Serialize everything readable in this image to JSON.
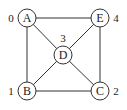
{
  "diagram": {
    "type": "undirected-graph",
    "colors": {
      "stroke": "#333333",
      "node_fill": "#ffffff",
      "text": "#222222",
      "background": "#ffffff"
    },
    "node_radius": 9,
    "nodes": [
      {
        "id": "A",
        "label": "A",
        "index": "0",
        "x": 27,
        "y": 18,
        "index_x": 11,
        "index_y": 22
      },
      {
        "id": "B",
        "label": "B",
        "index": "1",
        "x": 27,
        "y": 91,
        "index_x": 11,
        "index_y": 95
      },
      {
        "id": "C",
        "label": "C",
        "index": "2",
        "x": 100,
        "y": 91,
        "index_x": 116,
        "index_y": 95
      },
      {
        "id": "D",
        "label": "D",
        "index": "3",
        "x": 63,
        "y": 55,
        "index_x": 63,
        "index_y": 42
      },
      {
        "id": "E",
        "label": "E",
        "index": "4",
        "x": 100,
        "y": 18,
        "index_x": 116,
        "index_y": 22
      }
    ],
    "edges": [
      {
        "from": "A",
        "to": "E"
      },
      {
        "from": "A",
        "to": "B"
      },
      {
        "from": "A",
        "to": "D"
      },
      {
        "from": "E",
        "to": "D"
      },
      {
        "from": "E",
        "to": "C"
      },
      {
        "from": "D",
        "to": "B"
      },
      {
        "from": "D",
        "to": "C"
      },
      {
        "from": "B",
        "to": "C"
      }
    ]
  }
}
